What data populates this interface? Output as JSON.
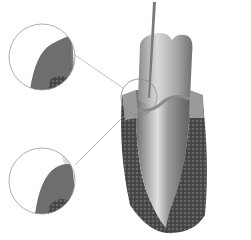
{
  "figure": {
    "background": "#ffffff",
    "callouts": [
      {
        "name": "upper-magnified-view",
        "cx": 42,
        "cy": 57,
        "r": 33
      },
      {
        "name": "lower-magnified-view",
        "cx": 42,
        "cy": 181,
        "r": 33
      },
      {
        "name": "focus-circle",
        "cx": 139,
        "cy": 97,
        "r": 18
      }
    ],
    "colors": {
      "enamel": "#bdbdbd",
      "root": "#9a9a9a",
      "bone": "#4a4a4a",
      "gum": "#8a8a8a",
      "probe": "#7a7a7a",
      "outline": "#888888"
    }
  }
}
